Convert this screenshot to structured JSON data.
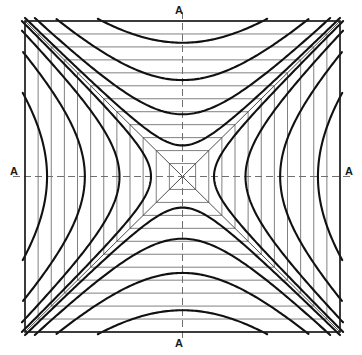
{
  "figure": {
    "background_color": "#ffffff"
  },
  "frame": {
    "x": 25,
    "y": 21,
    "width": 315,
    "height": 311,
    "stroke": "#1a1a1a",
    "stroke_width": 1.7
  },
  "center": {
    "x": 182.5,
    "y": 176.5
  },
  "axes": {
    "stroke": "#6f6f6f",
    "stroke_width": 1.0,
    "dash": "7,4",
    "labels": [
      {
        "id": "label-top",
        "name": "axis-label-top",
        "text": "A",
        "position": "top"
      },
      {
        "id": "label-right",
        "name": "axis-label-right",
        "text": "A",
        "position": "right"
      },
      {
        "id": "label-bottom",
        "name": "axis-label-bottom",
        "text": "A",
        "position": "bottom"
      },
      {
        "id": "label-left",
        "name": "axis-label-left",
        "text": "A",
        "position": "left"
      }
    ]
  },
  "grid": {
    "stroke": "#6a6a6a",
    "stroke_width": 0.85,
    "divisions": 11,
    "note": "Nested rectangles: horizontal segments in the upper and lower sectors, vertical segments in the left and right sectors."
  },
  "diagonals": {
    "stroke": "#3a3a3a",
    "stroke_width": 0.9,
    "count": 4,
    "note": "Asymptotes running from each corner of the frame to the centre."
  },
  "curves": {
    "stroke": "#111111",
    "stroke_width": 2.1,
    "per_sector": 4,
    "total": 16,
    "note": "Hyperbolae asymptotic to the corner diagonals; four open toward each side of the square.",
    "parameters": [
      0.2,
      0.4,
      0.62,
      0.86
    ]
  },
  "chart_data": {
    "type": "line",
    "xlabel": "",
    "ylabel": "",
    "xlim": [
      -1,
      1
    ],
    "ylim": [
      -1,
      1
    ],
    "grid": true,
    "legend": false,
    "annotations": [
      "A",
      "A",
      "A",
      "A"
    ],
    "series": [
      {
        "name": "asymptote-diagonal-1",
        "equation": "y = x",
        "values": [
          [
            -1,
            -1
          ],
          [
            1,
            1
          ]
        ]
      },
      {
        "name": "asymptote-diagonal-2",
        "equation": "y = -x",
        "values": [
          [
            -1,
            1
          ],
          [
            1,
            -1
          ]
        ]
      },
      {
        "name": "hyperbola-top-1",
        "equation": "y^2 - x^2 = 0.20^2",
        "k": 0.2,
        "opens": "up"
      },
      {
        "name": "hyperbola-top-2",
        "equation": "y^2 - x^2 = 0.40^2",
        "k": 0.4,
        "opens": "up"
      },
      {
        "name": "hyperbola-top-3",
        "equation": "y^2 - x^2 = 0.62^2",
        "k": 0.62,
        "opens": "up"
      },
      {
        "name": "hyperbola-top-4",
        "equation": "y^2 - x^2 = 0.86^2",
        "k": 0.86,
        "opens": "up"
      },
      {
        "name": "hyperbola-bottom-1",
        "equation": "y^2 - x^2 = 0.20^2",
        "k": 0.2,
        "opens": "down"
      },
      {
        "name": "hyperbola-bottom-2",
        "equation": "y^2 - x^2 = 0.40^2",
        "k": 0.4,
        "opens": "down"
      },
      {
        "name": "hyperbola-bottom-3",
        "equation": "y^2 - x^2 = 0.62^2",
        "k": 0.62,
        "opens": "down"
      },
      {
        "name": "hyperbola-bottom-4",
        "equation": "y^2 - x^2 = 0.86^2",
        "k": 0.86,
        "opens": "down"
      },
      {
        "name": "hyperbola-left-1",
        "equation": "x^2 - y^2 = 0.20^2",
        "k": 0.2,
        "opens": "left"
      },
      {
        "name": "hyperbola-left-2",
        "equation": "x^2 - y^2 = 0.40^2",
        "k": 0.4,
        "opens": "left"
      },
      {
        "name": "hyperbola-left-3",
        "equation": "x^2 - y^2 = 0.62^2",
        "k": 0.62,
        "opens": "left"
      },
      {
        "name": "hyperbola-left-4",
        "equation": "x^2 - y^2 = 0.86^2",
        "k": 0.86,
        "opens": "left"
      },
      {
        "name": "hyperbola-right-1",
        "equation": "x^2 - y^2 = 0.20^2",
        "k": 0.2,
        "opens": "right"
      },
      {
        "name": "hyperbola-right-2",
        "equation": "x^2 - y^2 = 0.40^2",
        "k": 0.4,
        "opens": "right"
      },
      {
        "name": "hyperbola-right-3",
        "equation": "x^2 - y^2 = 0.62^2",
        "k": 0.62,
        "opens": "right"
      },
      {
        "name": "hyperbola-right-4",
        "equation": "x^2 - y^2 = 0.86^2",
        "k": 0.86,
        "opens": "right"
      }
    ]
  }
}
